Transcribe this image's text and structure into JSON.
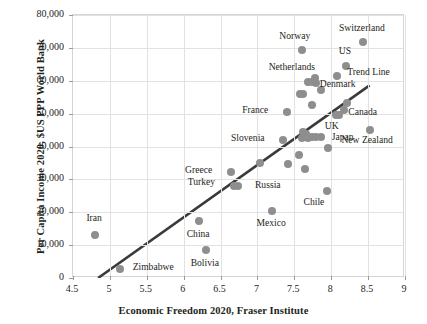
{
  "chart_data": {
    "type": "scatter",
    "title": "",
    "xlabel": "Economic Freedom 2020, Fraser Institute",
    "ylabel": "Per Capita Income 2020, $US PPP World Bank",
    "xlim": [
      4.5,
      9
    ],
    "ylim": [
      0,
      80000
    ],
    "xticks": [
      "4.5",
      "5",
      "5.5",
      "6",
      "6.5",
      "7",
      "7.5",
      "8",
      "8.5",
      "9"
    ],
    "xtick_values": [
      4.5,
      5,
      5.5,
      6,
      6.5,
      7,
      7.5,
      8,
      8.5,
      9
    ],
    "yticks": [
      "0",
      "10,000",
      "20,000",
      "30,000",
      "40,000",
      "50,000",
      "60,000",
      "70,000",
      "80,000"
    ],
    "ytick_values": [
      0,
      10000,
      20000,
      30000,
      40000,
      50000,
      60000,
      70000,
      80000
    ],
    "grid": true,
    "legend": false,
    "marker_color": "#8e8e8e",
    "trendline_color": "#3a3a3a",
    "annotations": [
      {
        "text": "Trend Line",
        "x": 8.52,
        "y": 62000,
        "align": "c"
      }
    ],
    "trendline": {
      "x0": 4.84,
      "y0": 0,
      "x1": 8.52,
      "y1": 58600
    },
    "points": [
      {
        "label": "Iran",
        "x": 4.8,
        "y": 13100,
        "lx": 4.8,
        "ly": 17600,
        "align": "c"
      },
      {
        "label": "Zimbabwe",
        "x": 5.14,
        "y": 2700,
        "lx": 5.6,
        "ly": 2700,
        "align": "c"
      },
      {
        "label": "China",
        "x": 6.21,
        "y": 17200,
        "lx": 6.21,
        "ly": 12700,
        "align": "c"
      },
      {
        "label": "Bolivia",
        "x": 6.3,
        "y": 8400,
        "lx": 6.3,
        "ly": 3900,
        "align": "c"
      },
      {
        "label": "Greece",
        "x": 6.64,
        "y": 32200,
        "lx": 6.4,
        "ly": 32200,
        "align": "r"
      },
      {
        "label": "Turkey",
        "x": 6.68,
        "y": 28000,
        "lx": 6.44,
        "ly": 28600,
        "align": "r"
      },
      {
        "label": "Russia",
        "x": 6.74,
        "y": 28000,
        "lx": 6.98,
        "ly": 27700,
        "align": "l"
      },
      {
        "label": "Mexico",
        "x": 7.2,
        "y": 20500,
        "lx": 7.2,
        "ly": 16200,
        "align": "c"
      },
      {
        "label": "Chile",
        "x": 7.94,
        "y": 26600,
        "lx": 7.78,
        "ly": 22400,
        "align": "c"
      },
      {
        "label": "Slovenia",
        "x": 7.35,
        "y": 42000,
        "lx": 7.11,
        "ly": 42000,
        "align": "r"
      },
      {
        "label": "France",
        "x": 7.4,
        "y": 50400,
        "lx": 7.16,
        "ly": 50400,
        "align": "r"
      },
      {
        "label": "Norway",
        "x": 7.6,
        "y": 69400,
        "lx": 7.52,
        "ly": 73100,
        "align": "c"
      },
      {
        "label": "Netherlands",
        "x": 7.78,
        "y": 60700,
        "lx": 7.48,
        "ly": 63700,
        "align": "c"
      },
      {
        "label": "Denmark",
        "x": 8.08,
        "y": 61500,
        "lx": 8.1,
        "ly": 58500,
        "align": "c"
      },
      {
        "label": "US",
        "x": 8.2,
        "y": 64500,
        "lx": 8.2,
        "ly": 68300,
        "align": "c"
      },
      {
        "label": "Switzerland",
        "x": 8.43,
        "y": 71800,
        "lx": 8.43,
        "ly": 75400,
        "align": "c"
      },
      {
        "label": "Canada",
        "x": 8.22,
        "y": 53100,
        "lx": 8.44,
        "ly": 49800,
        "align": "c"
      },
      {
        "label": "UK",
        "x": 8.06,
        "y": 49500,
        "lx": 8.02,
        "ly": 45700,
        "align": "c"
      },
      {
        "label": "Japan",
        "x": 7.86,
        "y": 43000,
        "lx": 8.02,
        "ly": 42200,
        "align": "l"
      },
      {
        "label": "New Zealand",
        "x": 8.52,
        "y": 45000,
        "lx": 8.5,
        "ly": 41300,
        "align": "c"
      },
      {
        "label": "",
        "x": 7.58,
        "y": 56100,
        "lx": 0,
        "ly": 0,
        "align": "c"
      },
      {
        "label": "",
        "x": 7.62,
        "y": 56000,
        "lx": 0,
        "ly": 0,
        "align": "c"
      },
      {
        "label": "",
        "x": 7.68,
        "y": 59500,
        "lx": 0,
        "ly": 0,
        "align": "c"
      },
      {
        "label": "",
        "x": 7.74,
        "y": 59600,
        "lx": 0,
        "ly": 0,
        "align": "c"
      },
      {
        "label": "",
        "x": 7.8,
        "y": 59400,
        "lx": 0,
        "ly": 0,
        "align": "c"
      },
      {
        "label": "",
        "x": 7.86,
        "y": 57200,
        "lx": 0,
        "ly": 0,
        "align": "c"
      },
      {
        "label": "",
        "x": 7.74,
        "y": 52500,
        "lx": 0,
        "ly": 0,
        "align": "c"
      },
      {
        "label": "",
        "x": 7.62,
        "y": 44500,
        "lx": 0,
        "ly": 0,
        "align": "c"
      },
      {
        "label": "",
        "x": 7.66,
        "y": 43800,
        "lx": 0,
        "ly": 0,
        "align": "c"
      },
      {
        "label": "",
        "x": 7.6,
        "y": 42600,
        "lx": 0,
        "ly": 0,
        "align": "c"
      },
      {
        "label": "",
        "x": 7.68,
        "y": 42500,
        "lx": 0,
        "ly": 0,
        "align": "c"
      },
      {
        "label": "",
        "x": 7.74,
        "y": 42900,
        "lx": 0,
        "ly": 0,
        "align": "c"
      },
      {
        "label": "",
        "x": 7.79,
        "y": 42900,
        "lx": 0,
        "ly": 0,
        "align": "c"
      },
      {
        "label": "",
        "x": 7.56,
        "y": 37400,
        "lx": 0,
        "ly": 0,
        "align": "c"
      },
      {
        "label": "",
        "x": 7.65,
        "y": 33200,
        "lx": 0,
        "ly": 0,
        "align": "c"
      },
      {
        "label": "",
        "x": 7.42,
        "y": 34800,
        "lx": 0,
        "ly": 0,
        "align": "c"
      },
      {
        "label": "",
        "x": 7.04,
        "y": 34900,
        "lx": 0,
        "ly": 0,
        "align": "c"
      },
      {
        "label": "",
        "x": 8.11,
        "y": 49600,
        "lx": 0,
        "ly": 0,
        "align": "c"
      },
      {
        "label": "",
        "x": 8.17,
        "y": 51200,
        "lx": 0,
        "ly": 0,
        "align": "c"
      },
      {
        "label": "",
        "x": 7.96,
        "y": 39600,
        "lx": 0,
        "ly": 0,
        "align": "c"
      }
    ]
  }
}
